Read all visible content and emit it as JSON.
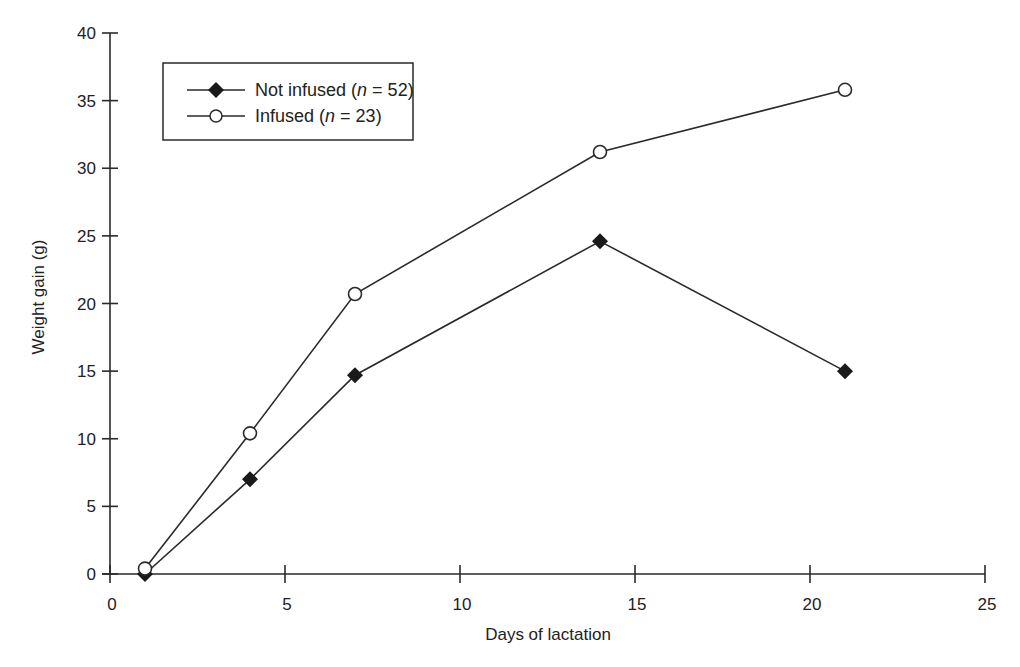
{
  "chart_data": {
    "type": "line",
    "title": "",
    "xlabel": "Days of lactation",
    "ylabel": "Weight gain (g)",
    "xlim": [
      0,
      25
    ],
    "ylim": [
      0,
      40
    ],
    "xticks": [
      0,
      5,
      10,
      15,
      20,
      25
    ],
    "yticks": [
      0,
      5,
      10,
      15,
      20,
      25,
      30,
      35,
      40
    ],
    "grid": false,
    "legend_position": "upper left (inside box)",
    "x": [
      1,
      4,
      7,
      14,
      21
    ],
    "series": [
      {
        "name": "Not infused",
        "n_label": "n",
        "n_value": "= 52",
        "marker": "filled-diamond",
        "values": [
          0,
          7.0,
          14.7,
          24.6,
          15.0
        ]
      },
      {
        "name": "Infused",
        "n_label": "n",
        "n_value": "= 23",
        "marker": "open-circle",
        "values": [
          0.4,
          10.4,
          20.7,
          31.2,
          35.8
        ]
      }
    ]
  },
  "colors": {
    "line": "#2a2a2a",
    "marker_fill_filled": "#1a1a1a",
    "marker_fill_open": "#ffffff",
    "background": "#ffffff"
  }
}
